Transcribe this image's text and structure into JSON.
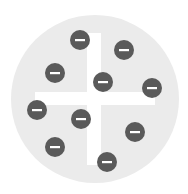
{
  "diagram": {
    "type": "plum-pudding-atom-model",
    "colors": {
      "background": "#ffffff",
      "sphere": "#ebebeb",
      "plus_sign": "#ffffff",
      "electron": "#5a5a5a",
      "electron_sign": "#ffffff"
    },
    "sphere": {
      "cx": 95,
      "cy": 99,
      "r": 84
    },
    "plus_sign": {
      "vertical": {
        "x": 87,
        "y": 33,
        "width": 14,
        "height": 132
      },
      "horizontal": {
        "x": 35,
        "y": 92,
        "width": 120,
        "height": 13
      }
    },
    "electron_radius": 10,
    "electron_label": "−",
    "electrons": [
      {
        "cx": 80,
        "cy": 40
      },
      {
        "cx": 124,
        "cy": 50
      },
      {
        "cx": 55,
        "cy": 73
      },
      {
        "cx": 103,
        "cy": 82
      },
      {
        "cx": 152,
        "cy": 88
      },
      {
        "cx": 37,
        "cy": 110
      },
      {
        "cx": 81,
        "cy": 119
      },
      {
        "cx": 135,
        "cy": 132
      },
      {
        "cx": 55,
        "cy": 147
      },
      {
        "cx": 107,
        "cy": 162
      }
    ]
  }
}
